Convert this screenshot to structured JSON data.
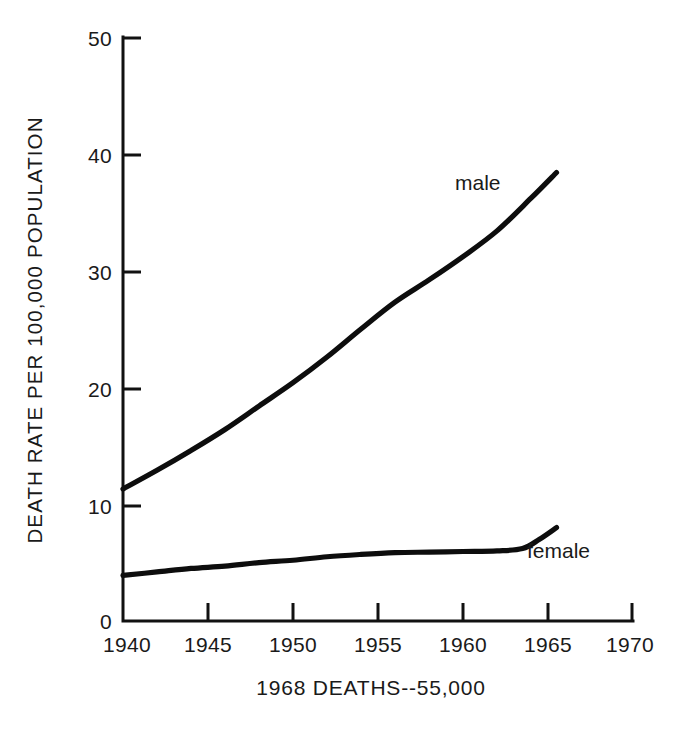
{
  "chart_data": {
    "type": "line",
    "title": "",
    "caption": "1968 DEATHS--55,000",
    "xlabel": "",
    "ylabel": "DEATH RATE PER 100,000 POPULATION",
    "xlim": [
      1940,
      1970
    ],
    "ylim": [
      0,
      50
    ],
    "xticks": [
      1940,
      1945,
      1950,
      1955,
      1960,
      1965,
      1970
    ],
    "xtick_labels": [
      "1940",
      "1945",
      "1950",
      "1955",
      "1960",
      "1965",
      "1970"
    ],
    "yticks": [
      0,
      10,
      20,
      30,
      40,
      50
    ],
    "ytick_labels": [
      "0",
      "10",
      "20",
      "30",
      "40",
      "50"
    ],
    "grid": false,
    "legend_position": "inline-end-of-line",
    "line_color": "#0d0d0d",
    "series": [
      {
        "name": "male",
        "label": "male",
        "x": [
          1940,
          1942,
          1944,
          1946,
          1948,
          1950,
          1952,
          1954,
          1956,
          1958,
          1960,
          1962,
          1964,
          1965.5
        ],
        "values": [
          11.3,
          12.9,
          14.6,
          16.4,
          18.4,
          20.4,
          22.6,
          25.0,
          27.3,
          29.2,
          31.2,
          33.4,
          36.2,
          38.4
        ]
      },
      {
        "name": "female",
        "label": "female",
        "x": [
          1940,
          1942,
          1944,
          1946,
          1948,
          1950,
          1952,
          1954,
          1956,
          1958,
          1960,
          1962,
          1963.5,
          1964.5,
          1965.5
        ],
        "values": [
          3.9,
          4.2,
          4.5,
          4.7,
          5.0,
          5.2,
          5.5,
          5.7,
          5.85,
          5.9,
          5.95,
          6.0,
          6.2,
          7.0,
          8.0
        ]
      }
    ]
  },
  "labels": {
    "male": "male",
    "female": "female",
    "y_axis_title": "DEATH RATE PER 100,000 POPULATION",
    "caption": "1968 DEATHS--55,000",
    "y_50": "50",
    "y_40": "40",
    "y_30": "30",
    "y_20": "20",
    "y_10": "10",
    "y_0": "0",
    "x_1940": "1940",
    "x_1945": "1945",
    "x_1950": "1950",
    "x_1955": "1955",
    "x_1960": "1960",
    "x_1965": "1965",
    "x_1970": "1970"
  }
}
